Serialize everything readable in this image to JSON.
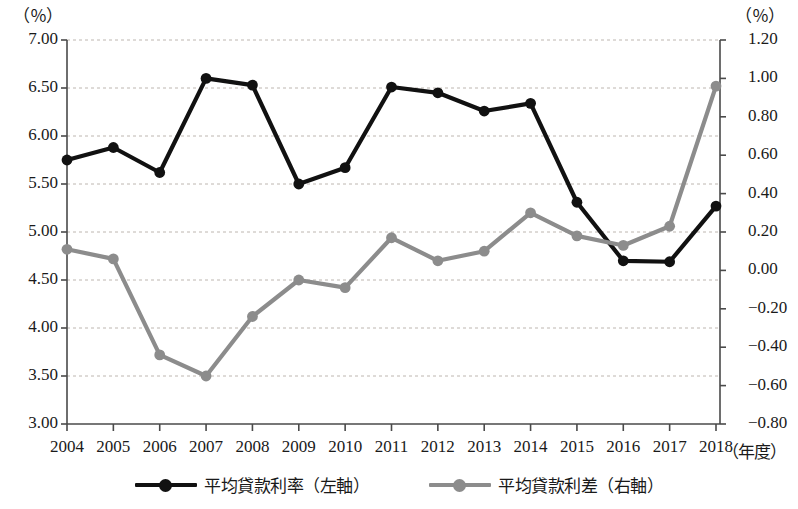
{
  "chart_data": {
    "type": "line",
    "title": "",
    "xlabel": "（年度）",
    "left_unit": "（％）",
    "right_unit": "（％）",
    "categories": [
      "2004",
      "2005",
      "2006",
      "2007",
      "2008",
      "2009",
      "2010",
      "2011",
      "2012",
      "2013",
      "2014",
      "2015",
      "2016",
      "2017",
      "2018"
    ],
    "grid": true,
    "legend_position": "bottom",
    "left_axis": {
      "ylim": [
        3.0,
        7.0
      ],
      "tick_step": 0.5,
      "ticks": [
        "7.00",
        "6.50",
        "6.00",
        "5.50",
        "5.00",
        "4.50",
        "4.00",
        "3.50",
        "3.00"
      ],
      "tick_values": [
        7.0,
        6.5,
        6.0,
        5.5,
        5.0,
        4.5,
        4.0,
        3.5,
        3.0
      ]
    },
    "right_axis": {
      "ylim": [
        -0.8,
        1.2
      ],
      "tick_step": 0.2,
      "ticks": [
        "1.20",
        "1.00",
        "0.80",
        "0.60",
        "0.40",
        "0.20",
        "0.00",
        "−0.20",
        "−0.40",
        "−0.60",
        "−0.80"
      ],
      "tick_values": [
        1.2,
        1.0,
        0.8,
        0.6,
        0.4,
        0.2,
        0.0,
        -0.2,
        -0.4,
        -0.6,
        -0.8
      ]
    },
    "series": [
      {
        "name": "平均貸款利率（左軸）",
        "axis": "left",
        "color": "#111111",
        "values": [
          5.75,
          5.88,
          5.62,
          6.6,
          6.53,
          5.5,
          5.67,
          6.51,
          6.45,
          6.26,
          6.34,
          5.31,
          4.7,
          4.69,
          5.27
        ]
      },
      {
        "name": "平均貸款利差（右軸）",
        "axis": "right",
        "color": "#8c8c8c",
        "values": [
          0.11,
          0.06,
          -0.44,
          -0.55,
          -0.24,
          -0.05,
          -0.09,
          0.17,
          0.05,
          0.1,
          0.3,
          0.18,
          0.13,
          0.23,
          0.96
        ]
      }
    ]
  },
  "legend": [
    {
      "label": "平均貸款利率（左軸）",
      "color": "#111111"
    },
    {
      "label": "平均貸款利差（右軸）",
      "color": "#8c8c8c"
    }
  ]
}
